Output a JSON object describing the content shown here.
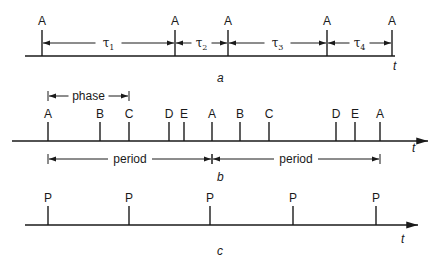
{
  "figure": {
    "panels": [
      {
        "id": "a",
        "caption": "a",
        "axis_label": "t",
        "events": [
          {
            "label": "A",
            "t": 0
          },
          {
            "label": "A",
            "t": 133
          },
          {
            "label": "A",
            "t": 186
          },
          {
            "label": "A",
            "t": 285
          },
          {
            "label": "A",
            "t": 350
          }
        ],
        "intervals": [
          {
            "symbol": "τ",
            "subscript": "1",
            "from": 0,
            "to": 1
          },
          {
            "symbol": "τ",
            "subscript": "2",
            "from": 1,
            "to": 2
          },
          {
            "symbol": "τ",
            "subscript": "3",
            "from": 2,
            "to": 3
          },
          {
            "symbol": "τ",
            "subscript": "4",
            "from": 3,
            "to": 4
          }
        ]
      },
      {
        "id": "b",
        "caption": "b",
        "axis_label": "t",
        "events": [
          {
            "label": "A",
            "t": 0
          },
          {
            "label": "B",
            "t": 52
          },
          {
            "label": "C",
            "t": 81
          },
          {
            "label": "D",
            "t": 121
          },
          {
            "label": "E",
            "t": 136
          },
          {
            "label": "A",
            "t": 164
          },
          {
            "label": "B",
            "t": 192
          },
          {
            "label": "C",
            "t": 221
          },
          {
            "label": "D",
            "t": 288
          },
          {
            "label": "E",
            "t": 307
          },
          {
            "label": "A",
            "t": 332
          }
        ],
        "top_bracket": {
          "label": "phase",
          "from": 0,
          "to": 2
        },
        "bottom_brackets": [
          {
            "label": "period",
            "from": 0,
            "to": 5
          },
          {
            "label": "period",
            "from": 5,
            "to": 10
          }
        ]
      },
      {
        "id": "c",
        "caption": "c",
        "axis_label": "t",
        "events": [
          {
            "label": "P",
            "t": 0
          },
          {
            "label": "P",
            "t": 81
          },
          {
            "label": "P",
            "t": 162
          },
          {
            "label": "P",
            "t": 245
          },
          {
            "label": "P",
            "t": 328
          }
        ]
      }
    ]
  }
}
